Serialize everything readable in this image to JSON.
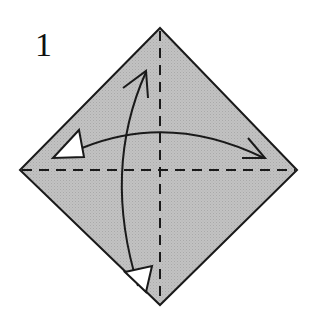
{
  "diagram": {
    "step_number": "1",
    "paper": {
      "shape": "square-diamond",
      "fill_color": "#bdbdbd",
      "edge_color": "#1a1a1a",
      "vertices": {
        "top": [
          160,
          28
        ],
        "right": [
          297,
          170
        ],
        "bottom": [
          160,
          305
        ],
        "left": [
          20,
          170
        ]
      }
    },
    "fold_lines": [
      {
        "name": "horizontal-diagonal",
        "style": "valley-dashed",
        "from": [
          20,
          170
        ],
        "to": [
          297,
          170
        ]
      },
      {
        "name": "vertical-diagonal",
        "style": "valley-dashed",
        "from": [
          160,
          28
        ],
        "to": [
          160,
          305
        ]
      }
    ],
    "arrows": [
      {
        "name": "horizontal-fold-and-unfold",
        "type": "fold-unfold",
        "from": [
          75,
          150
        ],
        "to": [
          265,
          158
        ]
      },
      {
        "name": "vertical-fold-and-unfold",
        "type": "fold-unfold",
        "from": [
          147,
          72
        ],
        "to": [
          143,
          290
        ]
      }
    ],
    "line_color": "#1a1a1a",
    "arrowhead_fill": "#ffffff"
  }
}
